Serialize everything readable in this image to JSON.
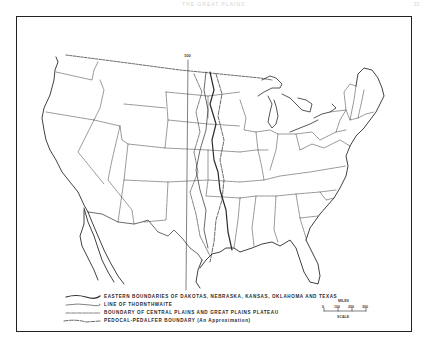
{
  "page": {
    "header_text": "THE GREAT PLAINS",
    "page_number": "33"
  },
  "map": {
    "subject": "United States outline map with state boundaries",
    "meridian_label": "100",
    "colors": {
      "ink": "#222222",
      "paper": "#ffffff"
    }
  },
  "legend": {
    "items": [
      {
        "line_style": "heavy-solid",
        "label": "EASTERN BOUNDARIES OF DAKOTAS, NEBRASKA, KANSAS, OKLAHOMA AND TEXAS"
      },
      {
        "line_style": "thin-solid",
        "label": "LINE OF THORNTHWAITE"
      },
      {
        "line_style": "dash-dot",
        "label": "BOUNDARY OF CENTRAL PLAINS AND GREAT PLAINS PLATEAU"
      },
      {
        "line_style": "long-dash",
        "label": "PEDOCAL-PEDALFER BOUNDARY  (An Approximation)"
      }
    ]
  },
  "scale": {
    "unit": "MILES",
    "ticks": [
      "0",
      "100",
      "200",
      "300"
    ],
    "title": "SCALE"
  }
}
